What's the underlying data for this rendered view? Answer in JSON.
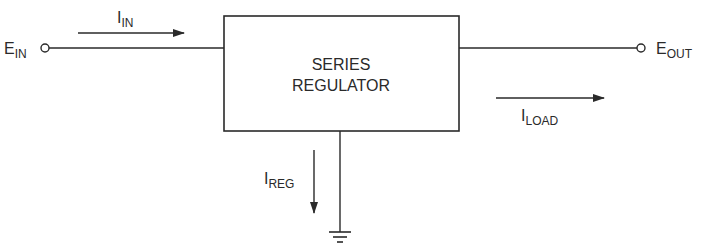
{
  "diagram": {
    "block": {
      "line1": "SERIES",
      "line2": "REGULATOR"
    },
    "input": {
      "terminal_main": "E",
      "terminal_sub": "IN",
      "current_main": "I",
      "current_sub": "IN"
    },
    "output": {
      "terminal_main": "E",
      "terminal_sub": "OUT",
      "current_main": "I",
      "current_sub": "LOAD"
    },
    "ground": {
      "current_main": "I",
      "current_sub": "REG"
    },
    "colors": {
      "line": "#2a2a2a",
      "background": "#ffffff"
    }
  }
}
